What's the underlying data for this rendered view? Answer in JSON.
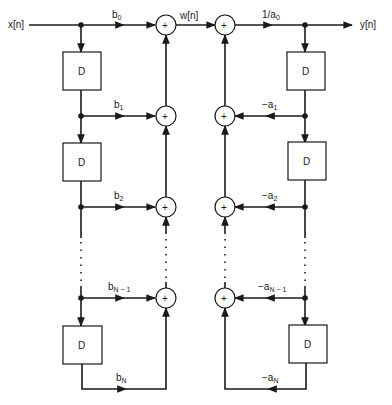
{
  "diagram": {
    "type": "signal-flow-graph",
    "structure": "Direct Form I IIR filter",
    "input_label": "x[n]",
    "output_label": "y[n]",
    "intermediate_label": "w[n]",
    "delay_label": "D",
    "adder_symbol": "+",
    "gain_output": {
      "main": "1/a",
      "sub": "0"
    },
    "feedforward_gains": [
      {
        "main": "b",
        "sub": "0"
      },
      {
        "main": "b",
        "sub": "1"
      },
      {
        "main": "b",
        "sub": "2"
      },
      {
        "main": "b",
        "sub": "N − 1"
      },
      {
        "main": "b",
        "sub": "N"
      }
    ],
    "feedback_gains": [
      {
        "main": "−a",
        "sub": "1"
      },
      {
        "main": "−a",
        "sub": "2"
      },
      {
        "main": "−a",
        "sub": "N − 1"
      },
      {
        "main": "−a",
        "sub": "N"
      }
    ],
    "colors": {
      "ink": "#1a1a1a",
      "background": "#ffffff"
    }
  }
}
